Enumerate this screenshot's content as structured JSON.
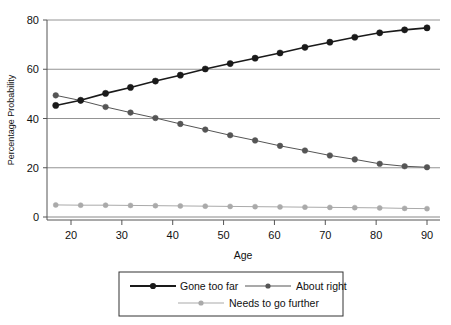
{
  "chart_data": {
    "type": "line",
    "title": "",
    "xlabel": "Age",
    "ylabel": "Percentage Probability",
    "xlim": [
      16,
      91
    ],
    "ylim": [
      0,
      80
    ],
    "xticks": [
      20,
      30,
      40,
      50,
      60,
      70,
      80,
      90
    ],
    "yticks": [
      0,
      20,
      40,
      60,
      80
    ],
    "grid": "horizontal",
    "legend_position": "bottom-outside",
    "x": [
      17,
      21.9,
      26.8,
      31.7,
      36.6,
      41.5,
      46.4,
      51.3,
      56.2,
      61.1,
      66.0,
      70.9,
      75.8,
      80.7,
      85.6,
      90
    ],
    "series": [
      {
        "name": "Gone too far",
        "color": "#1a1a1a",
        "marker": "circle-filled",
        "values": [
          45.3,
          47.4,
          50.2,
          52.6,
          55.2,
          57.6,
          60.1,
          62.3,
          64.5,
          66.6,
          68.9,
          71.0,
          73.0,
          74.8,
          76.0,
          76.8
        ]
      },
      {
        "name": "About right",
        "color": "#555555",
        "marker": "circle-filled",
        "values": [
          49.4,
          47.3,
          44.7,
          42.4,
          40.2,
          37.8,
          35.5,
          33.2,
          31.1,
          28.9,
          27.0,
          25.0,
          23.4,
          21.6,
          20.6,
          20.2
        ]
      },
      {
        "name": "Needs to go further",
        "color": "#aaaaaa",
        "marker": "circle-filled",
        "values": [
          4.9,
          4.8,
          4.8,
          4.7,
          4.6,
          4.5,
          4.4,
          4.3,
          4.2,
          4.1,
          4.0,
          3.9,
          3.8,
          3.7,
          3.5,
          3.4
        ]
      }
    ]
  },
  "axes": {
    "y_title": "Percentage Probability",
    "x_title": "Age",
    "ytick_labels": [
      "0",
      "20",
      "40",
      "60",
      "80"
    ],
    "xtick_labels": [
      "20",
      "30",
      "40",
      "50",
      "60",
      "70",
      "80",
      "90"
    ]
  },
  "legend": {
    "entries": [
      {
        "label": "Gone too far",
        "color": "#1a1a1a",
        "width": 1.9
      },
      {
        "label": "About right",
        "color": "#555555",
        "width": 1.1
      },
      {
        "label": "Needs to go further",
        "color": "#aaaaaa",
        "width": 1.1
      }
    ]
  },
  "colors": {
    "background": "#ffffff",
    "axis": "#555555",
    "grid": "#888888",
    "text": "#111111",
    "series_1": "#1a1a1a",
    "series_2": "#555555",
    "series_3": "#aaaaaa"
  }
}
